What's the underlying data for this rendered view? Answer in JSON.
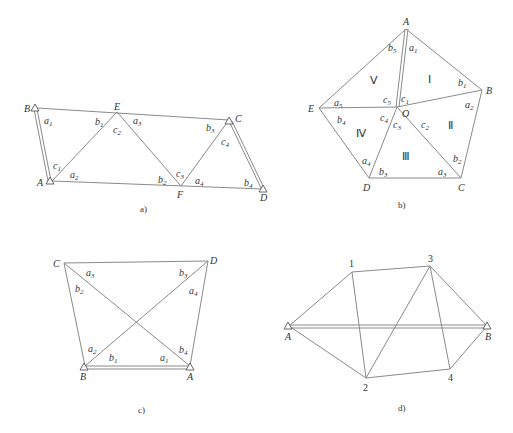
{
  "figures": [
    {
      "id": "a",
      "caption": "a)",
      "points": {
        "A": "A",
        "B": "B",
        "C": "C",
        "D": "D",
        "E": "E",
        "F": "F"
      },
      "angles": {
        "a1": "a",
        "b1": "b",
        "c1": "c",
        "a2": "a",
        "b2": "b",
        "c2": "c",
        "a3": "a",
        "b3": "b",
        "c3": "c",
        "a4": "a",
        "b4": "b",
        "c4": "c",
        "a5": "a"
      },
      "subs": {
        "s1": "1",
        "s2": "2",
        "s3": "3",
        "s4": "4",
        "s5": "5"
      },
      "baselines": [
        "AB",
        "CD"
      ]
    },
    {
      "id": "b",
      "caption": "b)",
      "points": {
        "A": "A",
        "B": "B",
        "C": "C",
        "D": "D",
        "E": "E",
        "O": "O"
      },
      "regions": {
        "r1": "Ⅰ",
        "r2": "Ⅱ",
        "r3": "Ⅲ",
        "r4": "Ⅳ",
        "r5": "Ⅴ"
      },
      "angles": {
        "a": "a",
        "b": "b",
        "c": "c"
      },
      "subs": {
        "s1": "1",
        "s2": "2",
        "s3": "3",
        "s4": "4",
        "s5": "5"
      },
      "baselines": [
        "AO"
      ]
    },
    {
      "id": "c",
      "caption": "c)",
      "points": {
        "A": "A",
        "B": "B",
        "C": "C",
        "D": "D"
      },
      "angles": {
        "a": "a",
        "b": "b"
      },
      "subs": {
        "s1": "1",
        "s2": "2",
        "s3": "3",
        "s4": "4"
      },
      "baselines": [
        "AB"
      ]
    },
    {
      "id": "d",
      "caption": "d)",
      "points": {
        "A": "A",
        "B": "B",
        "p1": "1",
        "p2": "2",
        "p3": "3",
        "p4": "4"
      },
      "baselines": [
        "AB"
      ]
    }
  ]
}
